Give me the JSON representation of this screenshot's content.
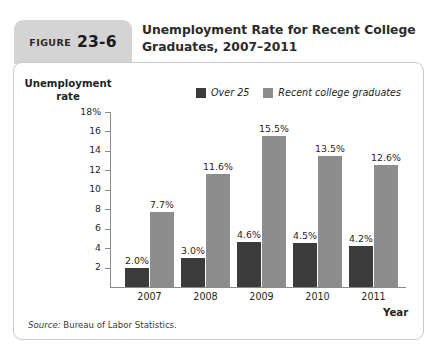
{
  "figure": {
    "label_word": "FIGURE",
    "number": "23-6",
    "title": "Unemployment Rate for Recent College Graduates, 2007–2011"
  },
  "source": {
    "prefix": "Source:",
    "text": "Bureau of Labor Statistics."
  },
  "colors": {
    "series_over25": "#3b3b3b",
    "series_recent_grads": "#8d8d8d",
    "tab_background": "#d4d4d4",
    "card_border": "#c9c9c9",
    "axis_line": "#8a8a8a"
  },
  "chart_data": {
    "type": "bar",
    "title": "Unemployment Rate for Recent College Graduates, 2007–2011",
    "xlabel": "Year",
    "ylabel": "Unemployment rate",
    "categories": [
      "2007",
      "2008",
      "2009",
      "2010",
      "2011"
    ],
    "ylim": [
      0,
      18
    ],
    "ytick_values": [
      18,
      16,
      14,
      12,
      10,
      8,
      6,
      4,
      2
    ],
    "ytick_labels": [
      "18%",
      "16",
      "14",
      "12",
      "10",
      "8",
      "6",
      "4",
      "2"
    ],
    "grid": false,
    "legend_position": "top-center",
    "series": [
      {
        "name": "Over 25",
        "color": "#3b3b3b",
        "values": [
          2.0,
          3.0,
          4.6,
          4.5,
          4.2
        ],
        "data_labels": [
          "2.0%",
          "3.0%",
          "4.6%",
          "4.5%",
          "4.2%"
        ]
      },
      {
        "name": "Recent college graduates",
        "color": "#8d8d8d",
        "values": [
          7.7,
          11.6,
          15.5,
          13.5,
          12.6
        ],
        "data_labels": [
          "7.7%",
          "11.6%",
          "15.5%",
          "13.5%",
          "12.6%"
        ]
      }
    ]
  }
}
